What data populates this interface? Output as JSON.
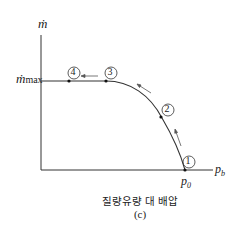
{
  "diagram": {
    "y_axis_label": "ṁ",
    "y_tick_label": "ṁ",
    "y_tick_sub": "max",
    "x_axis_label": "p",
    "x_axis_sub": "b",
    "x_tick_label": "p",
    "x_tick_sub": "0",
    "points": [
      {
        "id": "1",
        "label": "1"
      },
      {
        "id": "2",
        "label": "2"
      },
      {
        "id": "3",
        "label": "3"
      },
      {
        "id": "4",
        "label": "4"
      }
    ],
    "caption": "질량유량 대 배압",
    "sublabel": "(c)"
  }
}
